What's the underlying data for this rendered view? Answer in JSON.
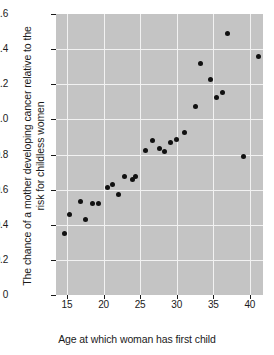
{
  "chart_data": {
    "type": "scatter",
    "title": "",
    "xlabel": "Age at which woman has first child",
    "ylabel": "The chance of a mother developing cancer relative to the risk for childless women",
    "xlim": [
      13.5,
      41.8
    ],
    "ylim": [
      0,
      1.6
    ],
    "xticks": [
      15,
      20,
      25,
      30,
      35,
      40
    ],
    "xtick_labels": [
      "15",
      "20",
      "25",
      "30",
      "35",
      "40"
    ],
    "yticks": [
      0,
      0.2,
      0.4,
      0.6,
      0.8,
      1.0,
      1.2,
      1.4,
      1.6
    ],
    "ytick_labels": [
      "0",
      "0.2",
      "0.4",
      "0.6",
      "0.8",
      "1.0",
      "1.2",
      "1.4",
      "1.6"
    ],
    "grid": true,
    "grid_color": "#f2f2f2",
    "plot_background": "#c4c4c4",
    "figure_background": "#ffffff",
    "marker_color": "#111111",
    "legend": null,
    "series": [
      {
        "name": "relative cancer risk",
        "points": [
          {
            "x": 14.6,
            "y": 0.35
          },
          {
            "x": 15.4,
            "y": 0.46
          },
          {
            "x": 16.8,
            "y": 0.535
          },
          {
            "x": 17.5,
            "y": 0.43
          },
          {
            "x": 18.5,
            "y": 0.52
          },
          {
            "x": 19.3,
            "y": 0.52
          },
          {
            "x": 20.5,
            "y": 0.61
          },
          {
            "x": 21.2,
            "y": 0.63
          },
          {
            "x": 22.0,
            "y": 0.575
          },
          {
            "x": 22.9,
            "y": 0.675
          },
          {
            "x": 23.9,
            "y": 0.655
          },
          {
            "x": 24.4,
            "y": 0.675
          },
          {
            "x": 25.8,
            "y": 0.82
          },
          {
            "x": 26.7,
            "y": 0.88
          },
          {
            "x": 27.6,
            "y": 0.835
          },
          {
            "x": 28.3,
            "y": 0.815
          },
          {
            "x": 29.1,
            "y": 0.87
          },
          {
            "x": 30.0,
            "y": 0.885
          },
          {
            "x": 31.0,
            "y": 0.925
          },
          {
            "x": 32.6,
            "y": 1.075
          },
          {
            "x": 33.2,
            "y": 1.32
          },
          {
            "x": 34.6,
            "y": 1.225
          },
          {
            "x": 35.4,
            "y": 1.125
          },
          {
            "x": 36.2,
            "y": 1.155
          },
          {
            "x": 37.0,
            "y": 1.49
          },
          {
            "x": 39.2,
            "y": 0.79
          },
          {
            "x": 41.2,
            "y": 1.36
          }
        ]
      }
    ]
  }
}
